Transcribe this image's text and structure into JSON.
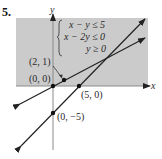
{
  "problem_number": "5.",
  "axes": {
    "x_label": "x",
    "y_label": "y"
  },
  "system": {
    "inequalities": [
      "x − y ≤ 5",
      "x − 2y ≤ 0",
      "y ≥ 0"
    ]
  },
  "points": [
    {
      "label": "(2, 1)",
      "x": 2,
      "y": 1
    },
    {
      "label": "(0, 0)",
      "x": 0,
      "y": 0
    },
    {
      "label": "(5, 0)",
      "x": 5,
      "y": 0
    },
    {
      "label": "(0, −5)",
      "x": 0,
      "y": -5
    }
  ],
  "lines": [
    {
      "equation": "x − y = 5"
    },
    {
      "equation": "x − 2y = 0"
    }
  ],
  "colors": {
    "shade": "#c9c9c9",
    "axis": "#888888",
    "line": "#222222"
  }
}
